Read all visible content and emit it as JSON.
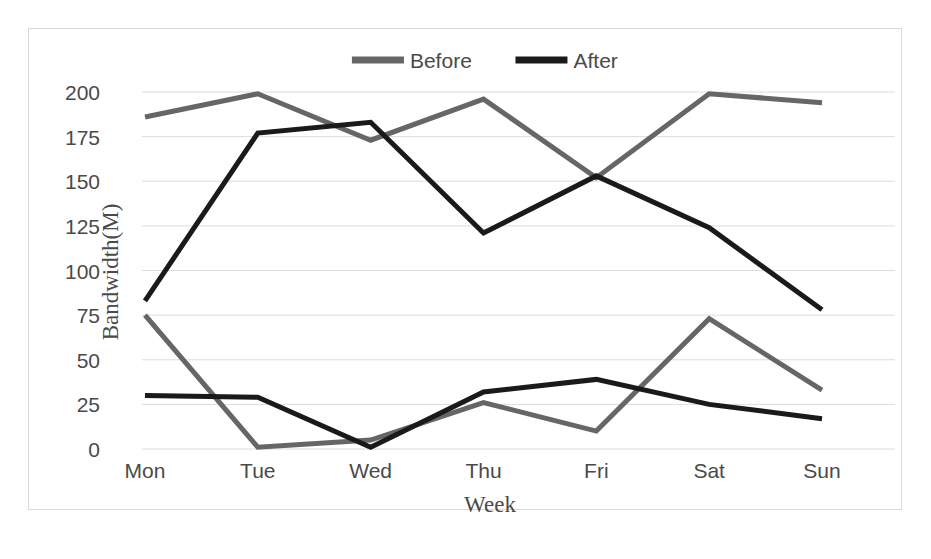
{
  "chart_data": {
    "type": "line",
    "title": "",
    "xlabel": "Week",
    "ylabel": "Bandwidth(M)",
    "categories": [
      "Mon",
      "Tue",
      "Wed",
      "Thu",
      "Fri",
      "Sat",
      "Sun"
    ],
    "ylim": [
      0,
      200
    ],
    "yticks": [
      0,
      25,
      50,
      75,
      100,
      125,
      150,
      175,
      200
    ],
    "ytick_labels": [
      "0",
      "25",
      "50",
      "75",
      "100",
      "125",
      "150",
      "175",
      "200"
    ],
    "grid": true,
    "legend_position": "top-center",
    "series": [
      {
        "name": "Before",
        "band": "upper",
        "color": "#666666",
        "values": [
          186,
          199,
          173,
          196,
          152,
          199,
          194
        ]
      },
      {
        "name": "After",
        "band": "upper",
        "color": "#1a1a1a",
        "values": [
          83,
          177,
          183,
          121,
          153,
          124,
          78
        ]
      },
      {
        "name": "Before",
        "band": "lower",
        "color": "#666666",
        "values": [
          75,
          1,
          5,
          26,
          10,
          73,
          33
        ]
      },
      {
        "name": "After",
        "band": "lower",
        "color": "#1a1a1a",
        "values": [
          30,
          29,
          1,
          32,
          39,
          25,
          17
        ]
      }
    ]
  },
  "legend": {
    "items": [
      {
        "label": "Before",
        "color": "#666666"
      },
      {
        "label": "After",
        "color": "#1a1a1a"
      }
    ]
  },
  "axes": {
    "y_title": "Bandwidth(M)",
    "x_title": "Week"
  }
}
